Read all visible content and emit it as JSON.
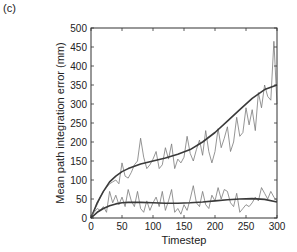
{
  "panel_label": "(c)",
  "chart_data": {
    "type": "line",
    "title": "",
    "xlabel": "Timestep",
    "ylabel": "Mean path integration error (mm)",
    "xlim": [
      0,
      300
    ],
    "ylim": [
      0,
      500
    ],
    "xticks": [
      0,
      50,
      100,
      150,
      200,
      250,
      300
    ],
    "yticks": [
      0,
      50,
      100,
      150,
      200,
      250,
      300,
      350,
      400,
      450,
      500
    ],
    "grid": false,
    "legend": null,
    "series": [
      {
        "name": "upper-raw",
        "style": "thin-gray",
        "x": [
          0,
          5,
          10,
          15,
          20,
          25,
          30,
          35,
          40,
          45,
          50,
          55,
          60,
          65,
          70,
          75,
          80,
          85,
          90,
          95,
          100,
          105,
          110,
          115,
          120,
          125,
          130,
          135,
          140,
          145,
          150,
          155,
          160,
          165,
          170,
          175,
          180,
          185,
          190,
          195,
          200,
          205,
          210,
          215,
          220,
          225,
          230,
          235,
          240,
          245,
          250,
          255,
          260,
          265,
          270,
          275,
          280,
          285,
          290,
          295,
          300
        ],
        "y": [
          5,
          20,
          35,
          55,
          70,
          80,
          90,
          95,
          100,
          90,
          145,
          110,
          105,
          120,
          140,
          150,
          210,
          160,
          130,
          140,
          155,
          175,
          130,
          140,
          185,
          155,
          195,
          130,
          155,
          145,
          160,
          215,
          170,
          150,
          180,
          205,
          165,
          230,
          175,
          145,
          175,
          235,
          185,
          210,
          240,
          175,
          200,
          265,
          215,
          225,
          290,
          245,
          285,
          230,
          330,
          290,
          350,
          320,
          310,
          465,
          300
        ]
      },
      {
        "name": "upper-smooth",
        "style": "thick-dark",
        "x": [
          0,
          10,
          20,
          30,
          40,
          50,
          60,
          80,
          100,
          120,
          140,
          160,
          180,
          200,
          220,
          240,
          260,
          280,
          300
        ],
        "y": [
          0,
          40,
          70,
          95,
          110,
          122,
          130,
          142,
          150,
          158,
          168,
          180,
          200,
          225,
          255,
          285,
          315,
          338,
          350
        ]
      },
      {
        "name": "lower-raw",
        "style": "thin-gray",
        "x": [
          0,
          5,
          10,
          15,
          20,
          25,
          30,
          35,
          40,
          45,
          50,
          55,
          60,
          65,
          70,
          75,
          80,
          85,
          90,
          95,
          100,
          105,
          110,
          115,
          120,
          125,
          130,
          135,
          140,
          145,
          150,
          155,
          160,
          165,
          170,
          175,
          180,
          185,
          190,
          195,
          200,
          205,
          210,
          215,
          220,
          225,
          230,
          235,
          240,
          245,
          250,
          255,
          260,
          265,
          270,
          275,
          280,
          285,
          290,
          295,
          300
        ],
        "y": [
          5,
          15,
          25,
          20,
          30,
          15,
          70,
          40,
          60,
          35,
          55,
          30,
          75,
          45,
          30,
          70,
          25,
          15,
          45,
          20,
          40,
          55,
          30,
          70,
          20,
          45,
          75,
          15,
          25,
          10,
          35,
          20,
          50,
          85,
          40,
          30,
          70,
          35,
          25,
          60,
          45,
          80,
          50,
          75,
          70,
          40,
          30,
          65,
          15,
          25,
          35,
          30,
          40,
          55,
          45,
          80,
          65,
          50,
          70,
          55,
          45
        ]
      },
      {
        "name": "lower-smooth",
        "style": "thick-dark",
        "x": [
          0,
          10,
          20,
          30,
          40,
          50,
          60,
          80,
          100,
          120,
          140,
          160,
          180,
          200,
          220,
          240,
          260,
          280,
          300
        ],
        "y": [
          0,
          15,
          25,
          32,
          37,
          40,
          41,
          41,
          40,
          39,
          39,
          40,
          42,
          45,
          48,
          50,
          51,
          49,
          42
        ]
      }
    ]
  }
}
